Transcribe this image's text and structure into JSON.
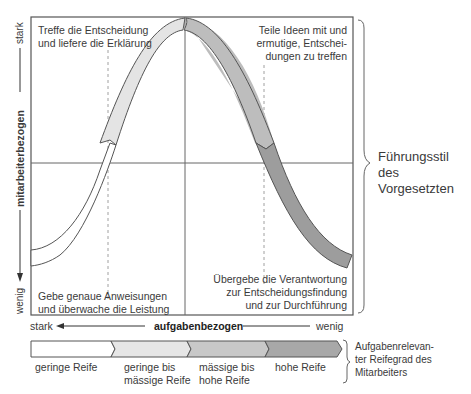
{
  "diagram": {
    "quadrants": {
      "top_left": [
        "Treffe die Entscheidung",
        "und liefere die Erklärung"
      ],
      "top_right": [
        "Teile Ideen mit und",
        "ermutige, Entschei-",
        "dungen zu treffen"
      ],
      "bottom_left": [
        "Gebe genaue Anweisungen",
        "und überwache die Leistung"
      ],
      "bottom_right": [
        "Übergebe die Verantwortung",
        "zur Entscheidungsfindung",
        "und zur Durchführung"
      ]
    },
    "y_axis": {
      "label": "mitarbeiterbezogen",
      "top": "stark",
      "bottom": "wenig"
    },
    "x_axis": {
      "label": "aufgabenbezogen",
      "left": "stark",
      "right": "wenig"
    },
    "bracket_right": [
      "Führungsstil",
      "des Vorgesetzten"
    ],
    "maturity_bar": {
      "segments": [
        {
          "lines": [
            "geringe Reife"
          ],
          "color": "#ffffff"
        },
        {
          "lines": [
            "geringe bis",
            "mässige Reife"
          ],
          "color": "#e6e6e6"
        },
        {
          "lines": [
            "mässige bis",
            "hohe Reife"
          ],
          "color": "#c4c4c4"
        },
        {
          "lines": [
            "hohe Reife"
          ],
          "color": "#a8a8a8"
        }
      ],
      "bracket_label": [
        "Aufgabenrelevan-",
        "ter Reifegrad des",
        "Mitarbeiters"
      ]
    },
    "curve_colors": {
      "s1": "#ffffff",
      "s2": "#e4e4e4",
      "s3": "#bdbdbd",
      "s4": "#9d9d9d",
      "stroke": "#555555"
    }
  }
}
